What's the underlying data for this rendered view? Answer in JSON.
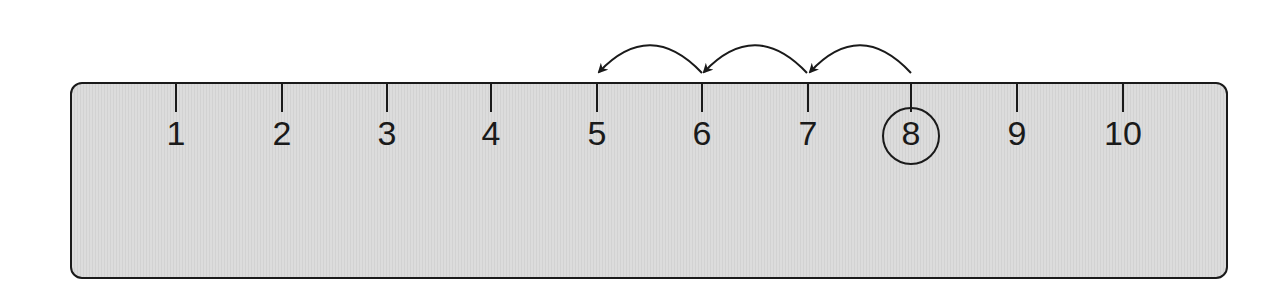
{
  "number_line": {
    "labels": [
      "1",
      "2",
      "3",
      "4",
      "5",
      "6",
      "7",
      "8",
      "9",
      "10"
    ],
    "circled": "8",
    "start": 8,
    "hops": [
      {
        "from": 8,
        "to": 7
      },
      {
        "from": 7,
        "to": 6
      },
      {
        "from": 6,
        "to": 5
      }
    ],
    "end": 5
  },
  "colors": {
    "ruler_fill": "#d8d8d8",
    "stroke": "#1a1a1a",
    "background": "#ffffff"
  }
}
